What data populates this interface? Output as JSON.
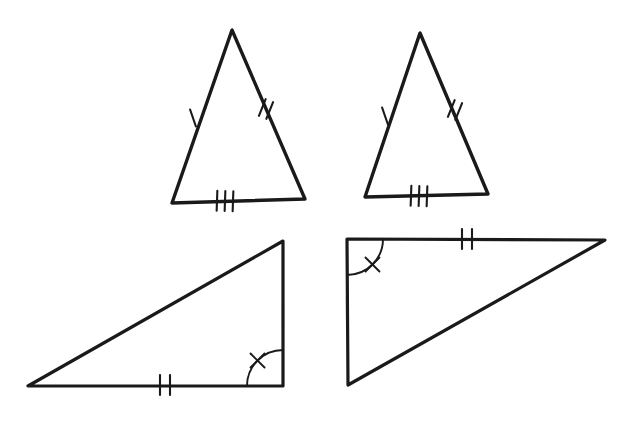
{
  "figure": {
    "title": "Congruent Triangles Diagram",
    "background_color": "#ffffff",
    "stroke_color": "#1a1a1a",
    "width": 628,
    "height": 421,
    "shape_count": "4"
  },
  "shapes": [
    {
      "id": "triangle-top-left",
      "name": "Top Left Isosceles Triangle",
      "type": "triangle",
      "orientation": "upright-isosceles",
      "vertices": [
        {
          "label": "apex",
          "x": 232,
          "y": 30
        },
        {
          "label": "base-left",
          "x": 172,
          "y": 203
        },
        {
          "label": "base-right",
          "x": 305,
          "y": 199
        }
      ],
      "stroke_width": "3.4",
      "marks": [
        {
          "kind": "tick",
          "count": "1",
          "edge": "left-leg",
          "position_x": 193,
          "position_y": 118,
          "angle_deg": 71
        },
        {
          "kind": "tick",
          "count": "2",
          "edge": "right-leg",
          "position_x": 266,
          "position_y": 109,
          "angle_deg": -68
        },
        {
          "kind": "tick",
          "count": "3",
          "edge": "base",
          "position_x": 225,
          "position_y": 201,
          "angle_deg": 2
        }
      ]
    },
    {
      "id": "triangle-top-right",
      "name": "Top Right Isosceles Triangle",
      "type": "triangle",
      "orientation": "upright-isosceles",
      "vertices": [
        {
          "label": "apex",
          "x": 420,
          "y": 33
        },
        {
          "label": "base-left",
          "x": 365,
          "y": 197
        },
        {
          "label": "base-right",
          "x": 488,
          "y": 194
        }
      ],
      "stroke_width": "3.4",
      "marks": [
        {
          "kind": "tick",
          "count": "1",
          "edge": "left-leg",
          "position_x": 385,
          "position_y": 116,
          "angle_deg": 71
        },
        {
          "kind": "tick",
          "count": "2",
          "edge": "right-leg",
          "position_x": 455,
          "position_y": 110,
          "angle_deg": -68
        },
        {
          "kind": "tick",
          "count": "3",
          "edge": "base",
          "position_x": 419,
          "position_y": 196,
          "angle_deg": 2
        }
      ]
    },
    {
      "id": "triangle-bottom-left",
      "name": "Bottom Left Right Triangle",
      "type": "triangle",
      "orientation": "right-angle-lower-right",
      "vertices": [
        {
          "label": "far-left",
          "x": 28,
          "y": 386
        },
        {
          "label": "corner",
          "x": 283,
          "y": 386
        },
        {
          "label": "top-right",
          "x": 283,
          "y": 241
        }
      ],
      "stroke_width": "3.2",
      "marks": [
        {
          "kind": "tick",
          "count": "2",
          "edge": "base",
          "position_x": 165,
          "position_y": 385,
          "angle_deg": 0
        },
        {
          "kind": "tick",
          "count": "1",
          "edge": "vertical-right",
          "position_x": 283,
          "position_y": 316,
          "angle_deg": 90
        },
        {
          "kind": "angle",
          "count": "1",
          "vertex": "corner",
          "radius": 36,
          "start_deg": 180,
          "end_deg": 270
        }
      ]
    },
    {
      "id": "triangle-bottom-right",
      "name": "Bottom Right Right Triangle",
      "type": "triangle",
      "orientation": "right-angle-upper-left",
      "vertices": [
        {
          "label": "corner",
          "x": 347,
          "y": 239
        },
        {
          "label": "far-right",
          "x": 605,
          "y": 240
        },
        {
          "label": "bottom-left",
          "x": 348,
          "y": 385
        }
      ],
      "stroke_width": "3.2",
      "marks": [
        {
          "kind": "tick",
          "count": "2",
          "edge": "top",
          "position_x": 467,
          "position_y": 239,
          "angle_deg": 0
        },
        {
          "kind": "tick",
          "count": "1",
          "edge": "vertical-left",
          "position_x": 347,
          "position_y": 308,
          "angle_deg": 90
        },
        {
          "kind": "angle",
          "count": "1",
          "vertex": "corner",
          "radius": 36,
          "start_deg": 0,
          "end_deg": 90
        }
      ]
    }
  ]
}
